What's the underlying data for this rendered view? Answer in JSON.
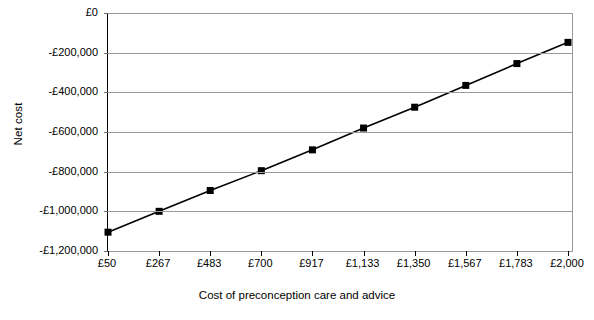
{
  "chart_data": {
    "type": "line",
    "title": "",
    "xlabel": "Cost of preconception care and advice",
    "ylabel": "Net cost",
    "x_tick_labels": [
      "£50",
      "£267",
      "£483",
      "£700",
      "£917",
      "£1,133",
      "£1,350",
      "£1,567",
      "£1,783",
      "£2,000"
    ],
    "y_tick_labels": [
      "£0",
      "-£200,000",
      "-£400,000",
      "-£600,000",
      "-£800,000",
      "-£1,000,000",
      "-£1,200,000"
    ],
    "y_tick_values": [
      0,
      -200000,
      -400000,
      -600000,
      -800000,
      -1000000,
      -1200000
    ],
    "ylim": [
      -1200000,
      0
    ],
    "categories": [
      50,
      267,
      483,
      700,
      917,
      1133,
      1350,
      1567,
      1783,
      2000
    ],
    "values": [
      -1105000,
      -1000000,
      -895000,
      -795000,
      -690000,
      -580000,
      -475000,
      -365000,
      -255000,
      -148000
    ],
    "series": [
      {
        "name": "Net cost",
        "marker": "square",
        "marker_color": "#000000",
        "line_color": "#000000",
        "values": [
          -1105000,
          -1000000,
          -895000,
          -795000,
          -690000,
          -580000,
          -475000,
          -365000,
          -255000,
          -148000
        ]
      }
    ],
    "grid": "horizontal",
    "legend": "none",
    "colors": {
      "line": "#000000",
      "marker": "#000000",
      "gridline": "#9a9a9a",
      "axis": "#000000",
      "background": "#ffffff"
    }
  }
}
